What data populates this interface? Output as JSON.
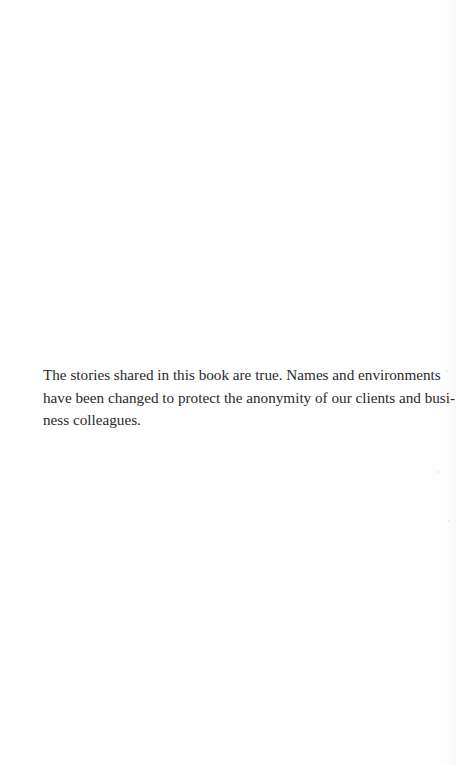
{
  "page": {
    "background": "#fefefe",
    "text_color": "#2a2a2a"
  },
  "notice": {
    "lines": [
      "The stories shared in this book are true.  Names and environments",
      "have been changed to protect the anonymity of our clients and busi-",
      "ness colleagues."
    ]
  }
}
